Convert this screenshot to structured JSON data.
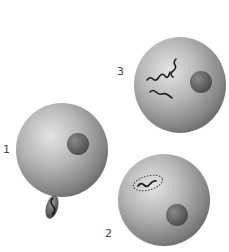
{
  "figure": {
    "cells": [
      {
        "id": "1",
        "label": "1",
        "features": [
          "dark nucleolus",
          "polar body bud with chromosome"
        ]
      },
      {
        "id": "2",
        "label": "2",
        "features": [
          "dark nucleolus",
          "chromosome in enclosed envelope"
        ]
      },
      {
        "id": "3",
        "label": "3",
        "features": [
          "dark nucleolus",
          "three separate wavy chromosomes"
        ]
      }
    ],
    "colors": {
      "background": "#ffffff",
      "cell_light": "#e6e6e6",
      "cell_dark": "#6d6d6d",
      "chromosome": "#1e1e1e",
      "label": "#444444"
    }
  }
}
